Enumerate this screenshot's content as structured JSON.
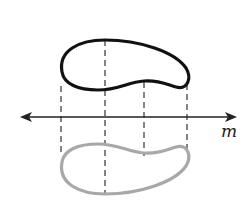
{
  "diagram": {
    "type": "reflection",
    "line_label": "m",
    "colors": {
      "original_shape": "#111111",
      "reflected_shape": "#a8a8a8",
      "line": "#222222",
      "guides": "#333333"
    },
    "guide_x": [
      61,
      104,
      143,
      187
    ],
    "axis_y": 117
  }
}
